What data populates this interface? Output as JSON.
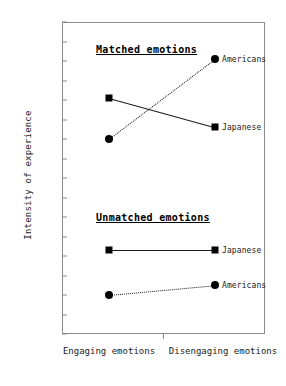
{
  "chart_data": {
    "type": "line",
    "title": "",
    "xlabel": "",
    "ylabel": "Intensity of experience",
    "categories": [
      "Engaging emotions",
      "Disengaging emotions"
    ],
    "ylim": [
      0.2,
      1.8
    ],
    "ytick_labels": [
      "1.80",
      "1.70",
      "1.60",
      "1.50",
      "1.40",
      "1.30",
      "1.20",
      "1.10",
      "1.00",
      "0.90",
      "0.80",
      "0.70",
      "0.60",
      "0.50",
      "0.40",
      "0.30",
      "0.20"
    ],
    "ytick_values": [
      1.8,
      1.7,
      1.6,
      1.5,
      1.4,
      1.3,
      1.2,
      1.1,
      1.0,
      0.9,
      0.8,
      0.7,
      0.6,
      0.5,
      0.4,
      0.3,
      0.2
    ],
    "grid": false,
    "legend_position": "right-of-endpoint",
    "groups": [
      {
        "name": "Matched emotions",
        "heading": "Matched emotions",
        "series": [
          {
            "name": "Japanese",
            "label": "Japanese",
            "marker": "square",
            "line": "solid",
            "values": [
              1.41,
              1.26
            ]
          },
          {
            "name": "Americans",
            "label": "Americans",
            "marker": "circle",
            "line": "dotted",
            "values": [
              1.2,
              1.61
            ]
          }
        ]
      },
      {
        "name": "Unmatched emotions",
        "heading": "Unmatched emotions",
        "series": [
          {
            "name": "Japanese",
            "label": "Japanese",
            "marker": "square",
            "line": "solid",
            "values": [
              0.63,
              0.63
            ]
          },
          {
            "name": "Americans",
            "label": "Americans",
            "marker": "circle",
            "line": "dotted",
            "values": [
              0.4,
              0.45
            ]
          }
        ]
      }
    ],
    "colors": {
      "ink": "#1a1a1a",
      "axis": "#8c8c8c",
      "marker": "#000000",
      "background": "#ffffff"
    }
  }
}
